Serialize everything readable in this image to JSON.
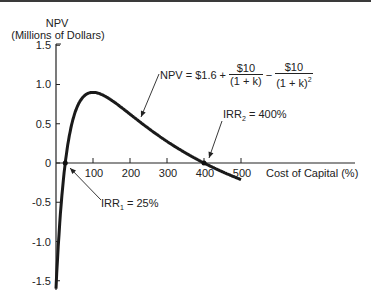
{
  "chart_data": {
    "type": "line",
    "title": "",
    "ylabel_line1": "NPV",
    "ylabel_line2": "(Millions of Dollars)",
    "xlabel": "Cost of Capital (%)",
    "ylim": [
      -1.6,
      1.5
    ],
    "xlim": [
      0,
      500
    ],
    "yticks": [
      "1.5",
      "1.0",
      "0.5",
      "0",
      "-0.5",
      "-1.0",
      "-1.5"
    ],
    "ytick_values": [
      1.5,
      1.0,
      0.5,
      0,
      -0.5,
      -1.0,
      -1.5
    ],
    "xticks": [
      "100",
      "200",
      "300",
      "400",
      "500"
    ],
    "xtick_values": [
      100,
      200,
      300,
      400,
      500
    ],
    "grid": false,
    "legend": null,
    "series": [
      {
        "name": "NPV",
        "x": [
          0,
          10,
          25,
          50,
          75,
          100,
          150,
          200,
          300,
          400,
          500
        ],
        "values": [
          -1.6,
          -0.77,
          0,
          0.62,
          0.85,
          0.9,
          0.8,
          0.62,
          0.28,
          0,
          -0.21
        ]
      }
    ],
    "annotations": {
      "formula": {
        "prefix": "NPV = $1.6 +",
        "frac1_num": "$10",
        "frac1_den": "(1 + k)",
        "minus": "−",
        "frac2_num": "$10",
        "frac2_den": "(1 + k)",
        "frac2_den_exp": "2"
      },
      "irr1": {
        "pre": "IRR",
        "sub": "1",
        "post": " = 25%",
        "x": 25,
        "y": 0
      },
      "irr2": {
        "pre": "IRR",
        "sub": "2",
        "post": " = 400%",
        "x": 400,
        "y": 0
      }
    }
  }
}
